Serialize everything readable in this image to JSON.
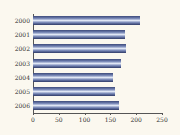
{
  "chart_data": {
    "type": "bar",
    "orientation": "horizontal",
    "title": "",
    "xlabel": "",
    "ylabel": "",
    "categories": [
      "2000",
      "2001",
      "2002",
      "2003",
      "2004",
      "2005",
      "2006"
    ],
    "values": [
      207,
      178,
      180,
      170,
      155,
      159,
      166
    ],
    "xlim": [
      0,
      250
    ],
    "xticks": [
      "0",
      "50",
      "100",
      "150",
      "200",
      "250"
    ],
    "grid": false,
    "legend": null,
    "bar_color": "#6f7fb0"
  }
}
